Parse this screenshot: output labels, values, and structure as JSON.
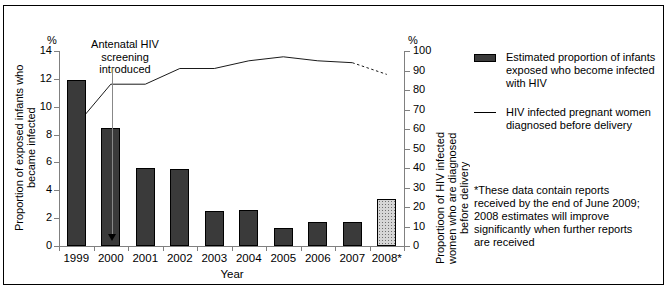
{
  "chart_data": {
    "type": "bar",
    "title": "",
    "xlabel": "Year",
    "categories": [
      "1999",
      "2000",
      "2001",
      "2002",
      "2003",
      "2004",
      "2005",
      "2006",
      "2007",
      "2008*"
    ],
    "axes": {
      "left": {
        "label": "Proportion of exposed infants who became infected",
        "unit": "%",
        "ticks": [
          0,
          2,
          4,
          6,
          8,
          10,
          12,
          14
        ],
        "ylim": [
          0,
          14
        ],
        "grid": false
      },
      "right": {
        "label": "Proportioon of HIV infected women who are diagnosed before delivery",
        "unit": "%",
        "ticks": [
          0,
          10,
          20,
          30,
          40,
          50,
          60,
          70,
          80,
          90,
          100
        ],
        "ylim": [
          0,
          100
        ],
        "grid": false
      }
    },
    "series": [
      {
        "name": "Estimated proportion of infants exposed who become infected with HIV",
        "type": "bar",
        "axis": "left",
        "values": [
          11.9,
          8.5,
          5.6,
          5.5,
          2.5,
          2.6,
          1.3,
          1.7,
          1.75,
          3.4
        ],
        "estimated_points": [
          "2008*"
        ]
      },
      {
        "name": "HIV infected pregnant women diagnosed before delivery",
        "type": "line",
        "axis": "right",
        "values": [
          62,
          83,
          83,
          91,
          91,
          95,
          97,
          95,
          94,
          88
        ],
        "dashed_from": "2007"
      }
    ],
    "annotations": [
      {
        "text": "Antenatal HIV screening introduced",
        "x": "between 1999 and 2000",
        "arrow": "down"
      }
    ],
    "legend": {
      "position": "right",
      "entries": [
        {
          "marker": "filled-bar",
          "label": "Estimated proportion of infants exposed who become infected with HIV"
        },
        {
          "marker": "line",
          "label": "HIV infected pregnant women diagnosed before delivery"
        }
      ]
    },
    "footnote": "*These data contain reports received by the end of June 2009; 2008 estimates will improve significantly when further reports are received"
  }
}
